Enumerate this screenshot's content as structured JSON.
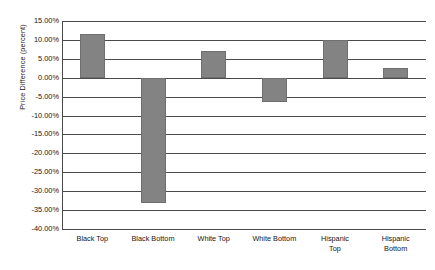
{
  "chart_data": {
    "type": "bar",
    "title": "",
    "subtitle": "",
    "xlabel": "",
    "ylabel": "Price Difference (percent)",
    "categories": [
      "Black Top",
      "Black Bottom",
      "White Top",
      "White Bottom",
      "Hispanic Top",
      "Hispanic Bottom"
    ],
    "category_lines": [
      [
        "Black Top"
      ],
      [
        "Black Bottom"
      ],
      [
        "White Top"
      ],
      [
        "White Bottom"
      ],
      [
        "Hispanic",
        "Top"
      ],
      [
        "Hispanic",
        "Bottom"
      ]
    ],
    "values": [
      11.5,
      -33.0,
      7.0,
      -6.5,
      10.0,
      2.5
    ],
    "value_labels": [
      "11.50%",
      "-33.00%",
      "7.00%",
      "-6.50%",
      "10.00%",
      "2.50%"
    ],
    "ylim": [
      -40.0,
      15.0
    ],
    "ytick_values": [
      15.0,
      10.0,
      5.0,
      0.0,
      -5.0,
      -10.0,
      -15.0,
      -20.0,
      -25.0,
      -30.0,
      -35.0,
      -40.0
    ],
    "ytick_labels": [
      "15.00%",
      "10.00%",
      "5.00%",
      "0.00%",
      "-5.00%",
      "-10.00%",
      "-15.00%",
      "-20.00%",
      "-25.00%",
      "-30.00%",
      "-35.00%",
      "-40.00%"
    ],
    "grid": true,
    "grid_axis": "y",
    "legend": false,
    "legend_position": "none",
    "bar_color": "#838383",
    "bar_edge_color": "#6f6f6f",
    "grid_color": "#4a4a4a",
    "background_color": "#ffffff",
    "text_color": "#161616"
  }
}
